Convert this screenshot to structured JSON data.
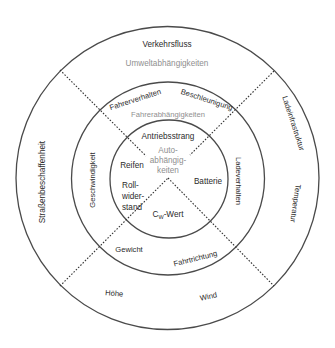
{
  "diagram": {
    "type": "concentric-circle-diagram",
    "colors": {
      "line": "#4a4a4a",
      "text": "#2b2b2b",
      "category_text": "#8f8f8f",
      "background": "#ffffff"
    },
    "outer_ring": {
      "category": "Umweltabhängigkeiten",
      "items": {
        "top": "Verkehrsfluss",
        "left": "Straßenbeschaffenheit",
        "right_upper": "Ladeinfrastruktur",
        "right_lower": "Temperatur",
        "bottom_left": "Höhe",
        "bottom_right": "Wind"
      }
    },
    "middle_ring": {
      "category": "Fahrerabhängigkeiten",
      "items": {
        "top_left": "Fahrerverhalten",
        "top_right": "Beschleunigung",
        "left": "Geschwindigkeit",
        "right": "Ladeverhalten",
        "bottom_left": "Gewicht",
        "bottom_right": "Fahrtrichtung"
      }
    },
    "inner_circle": {
      "category_lines": [
        "Auto-",
        "abhängig-",
        "keiten"
      ],
      "items": {
        "top": "Antriebsstrang",
        "left_upper": "Reifen",
        "left_lower_lines": [
          "Roll-",
          "wider-",
          "stand"
        ],
        "right": "Batterie",
        "bottom_prefix": "C",
        "bottom_subscript": "W",
        "bottom_suffix": "-Wert"
      }
    }
  }
}
